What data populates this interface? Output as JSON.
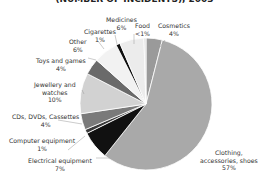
{
  "chart_data": {
    "type": "pie",
    "title": "(NUMBER OF INCIDENTS), 2003",
    "start_angle_deg": 0,
    "direction": "clockwise",
    "slices": [
      {
        "label": "Cosmetics",
        "value_text": "4%",
        "value": 4,
        "color": "#9a9a9a"
      },
      {
        "label": "Clothing, accessories, shoes",
        "value_text": "57%",
        "value": 57,
        "color": "#a9a9a9"
      },
      {
        "label": "Electrical equipment",
        "value_text": "7%",
        "value": 7,
        "color": "#111111"
      },
      {
        "label": "Computer equipment",
        "value_text": "1%",
        "value": 1,
        "color": "#3a3a3a"
      },
      {
        "label": "CDs, DVDs, Cassettes",
        "value_text": "4%",
        "value": 4,
        "color": "#7a7a7a"
      },
      {
        "label": "Jewellery and watches",
        "value_text": "10%",
        "value": 10,
        "color": "#d2d2d2"
      },
      {
        "label": "Toys and games",
        "value_text": "4%",
        "value": 4,
        "color": "#6a6a6a"
      },
      {
        "label": "Other",
        "value_text": "6%",
        "value": 6,
        "color": "#f2f2f2"
      },
      {
        "label": "Cigarettes",
        "value_text": "1%",
        "value": 1,
        "color": "#111111"
      },
      {
        "label": "Medicines",
        "value_text": "6%",
        "value": 6,
        "color": "#ececec"
      },
      {
        "label": "Food",
        "value_text": "<1%",
        "value": 0.5,
        "color": "#dcdcdc"
      }
    ]
  },
  "labels": {
    "cosmetics": {
      "name": "Cosmetics",
      "pct": "4%"
    },
    "clothing": {
      "line1": "Clothing,",
      "line2": "accessories, shoes",
      "pct": "57%"
    },
    "electrical": {
      "name": "Electrical equipment",
      "pct": "7%"
    },
    "computer": {
      "name": "Computer equipment",
      "pct": "1%"
    },
    "cds": {
      "name": "CDs, DVDs, Cassettes",
      "pct": "4%"
    },
    "jewellery": {
      "line1": "Jewellery and",
      "line2": "watches",
      "pct": "10%"
    },
    "toys": {
      "name": "Toys and games",
      "pct": "4%"
    },
    "other": {
      "name": "Other",
      "pct": "6%"
    },
    "cigarettes": {
      "name": "Cigarettes",
      "pct": "1%"
    },
    "medicines": {
      "name": "Medicines",
      "pct": "6%"
    },
    "food": {
      "name": "Food",
      "pct": "<1%"
    }
  }
}
